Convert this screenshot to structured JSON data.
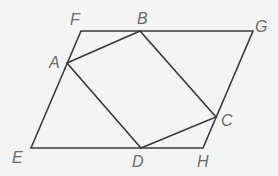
{
  "figure": {
    "colors": {
      "line": "#3a3a3a",
      "label": "#6a6a6a",
      "background": "#f4f4f4"
    },
    "points": {
      "F": {
        "label": "F",
        "x": 81,
        "y": 31,
        "lx": 70,
        "ly": 25
      },
      "B": {
        "label": "B",
        "x": 140,
        "y": 31,
        "lx": 137,
        "ly": 24
      },
      "G": {
        "label": "G",
        "x": 253,
        "y": 31,
        "lx": 255,
        "ly": 32
      },
      "A": {
        "label": "A",
        "x": 67,
        "y": 63,
        "lx": 49,
        "ly": 68
      },
      "C": {
        "label": "C",
        "x": 216,
        "y": 117,
        "lx": 221,
        "ly": 126
      },
      "E": {
        "label": "E",
        "x": 31,
        "y": 148,
        "lx": 12,
        "ly": 163
      },
      "D": {
        "label": "D",
        "x": 141,
        "y": 148,
        "lx": 132,
        "ly": 167
      },
      "H": {
        "label": "H",
        "x": 203,
        "y": 148,
        "lx": 197,
        "ly": 167
      }
    },
    "outer_shape": [
      "E",
      "F",
      "G",
      "H"
    ],
    "inner_shape": [
      "A",
      "B",
      "C",
      "D"
    ]
  }
}
